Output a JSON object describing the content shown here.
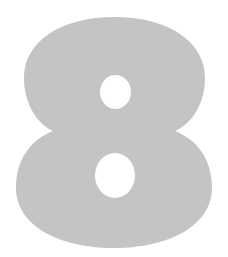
{
  "glyph": {
    "character": "8",
    "fill_color": "#c4c4c4",
    "background_color": "#ffffff",
    "hole_color": "#ffffff"
  }
}
